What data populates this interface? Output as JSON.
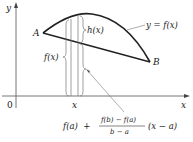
{
  "diagram": {
    "axes": {
      "y_label": "y",
      "x_label": "x",
      "origin_label": "0"
    },
    "points": {
      "A": "A",
      "B": "B"
    },
    "curve_label": "y = f(x)",
    "x_point_label": "x",
    "brace_labels": {
      "h": "h(x)",
      "f": "f(x)"
    },
    "secant_formula": {
      "lead": "f(a)  +",
      "numerator": "f(b) − f(a)",
      "denominator": "b − a",
      "tail": "(x − a)"
    },
    "colors": {
      "ink": "#222222",
      "axis": "#555555",
      "thin": "#777777"
    }
  }
}
